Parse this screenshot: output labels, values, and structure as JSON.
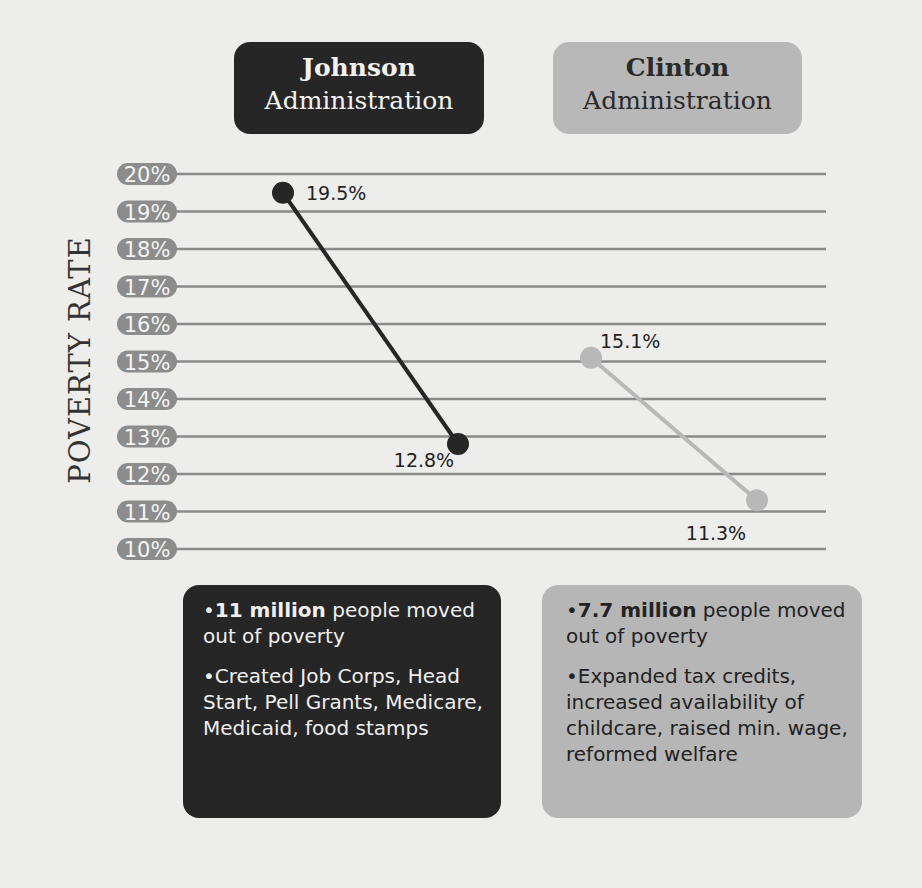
{
  "headers": {
    "johnson": {
      "name": "Johnson",
      "sub": "Administration"
    },
    "clinton": {
      "name": "Clinton",
      "sub": "Administration"
    }
  },
  "colors": {
    "johnson": "#262626",
    "clinton": "#b8b8b8",
    "tick_pill": "#8c8c8c",
    "grid": "#8a8a8a",
    "background": "#ededeb"
  },
  "cards": {
    "johnson": {
      "stat_bold": "11 million",
      "stat_rest": " people moved out of poverty",
      "programs": "Created Job Corps, Head Start, Pell Grants, Medicare, Medicaid, food stamps"
    },
    "clinton": {
      "stat_bold": "7.7 million",
      "stat_rest": " people moved out of poverty",
      "programs": "Expanded tax credits, increased availability of childcare, raised min. wage, reformed welfare"
    }
  },
  "chart_data": {
    "type": "line",
    "title": "",
    "xlabel": "",
    "ylabel": "POVERTY RATE",
    "ylim": [
      10,
      20
    ],
    "yticks": [
      "20%",
      "19%",
      "18%",
      "17%",
      "16%",
      "15%",
      "14%",
      "13%",
      "12%",
      "11%",
      "10%"
    ],
    "grid": true,
    "series": [
      {
        "name": "Johnson Administration",
        "color": "#262626",
        "values": [
          19.5,
          12.8
        ],
        "labels": [
          "19.5%",
          "12.8%"
        ]
      },
      {
        "name": "Clinton Administration",
        "color": "#b8b8b8",
        "values": [
          15.1,
          11.3
        ],
        "labels": [
          "15.1%",
          "11.3%"
        ]
      }
    ]
  }
}
